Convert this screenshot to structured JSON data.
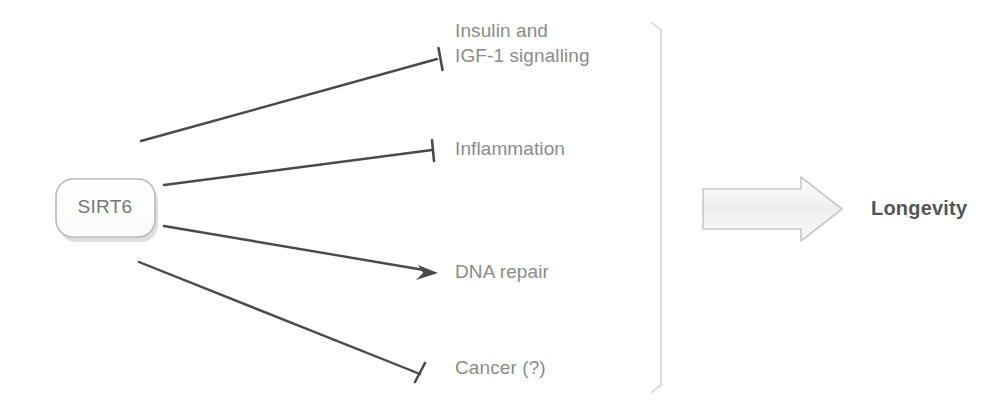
{
  "diagram": {
    "source_node": {
      "label": "SIRT6",
      "shape": "rounded-rectangle",
      "text_color": "#777777",
      "border_color": "#b9b9b9",
      "shadow_color": "#cfcfcf"
    },
    "outcome": {
      "label": "Longevity",
      "text_color": "#555555",
      "arrow_style": "hollow-block-arrow",
      "arrow_fill": "#f2f2f2",
      "arrow_border": "#c8c8c8"
    },
    "bracket": {
      "orientation": "vertical",
      "color": "#dcdcdc",
      "x": 662,
      "top": 22,
      "bottom": 392
    },
    "edges": [
      {
        "id": "edge-insulin",
        "target": "insulin",
        "relation": "inhibition",
        "arrowhead": "t-bar",
        "color": "#4a4a4a"
      },
      {
        "id": "edge-inflammation",
        "target": "inflammation",
        "relation": "inhibition",
        "arrowhead": "t-bar",
        "color": "#4a4a4a"
      },
      {
        "id": "edge-dna-repair",
        "target": "dna_repair",
        "relation": "activation",
        "arrowhead": "pointed",
        "color": "#4a4a4a"
      },
      {
        "id": "edge-cancer",
        "target": "cancer",
        "relation": "inhibition",
        "arrowhead": "t-bar",
        "color": "#4a4a4a"
      }
    ],
    "targets": {
      "insulin": {
        "line1": "Insulin and",
        "line2": "IGF-1 signalling",
        "full": "Insulin and IGF-1 signalling"
      },
      "inflammation": {
        "label": "Inflammation"
      },
      "dna_repair": {
        "label": "DNA repair"
      },
      "cancer": {
        "label": "Cancer (?)"
      }
    }
  }
}
